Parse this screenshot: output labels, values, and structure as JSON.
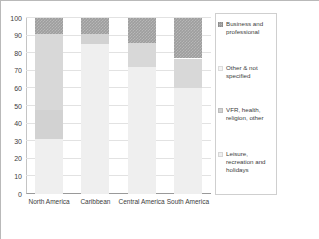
{
  "chart_data": {
    "type": "bar",
    "subtype": "stacked-bar-100",
    "title": "",
    "xlabel": "",
    "ylabel": "",
    "ylim": [
      0,
      100
    ],
    "yticks": [
      0,
      10,
      20,
      30,
      40,
      50,
      60,
      70,
      80,
      90,
      100
    ],
    "grid": true,
    "legend_position": "right",
    "categories": [
      "North America",
      "Caribbean",
      "Central America",
      "South America"
    ],
    "series": [
      {
        "name": "Leisure, recreation and holidays",
        "color": "#efefef",
        "values": [
          31,
          85,
          72,
          60
        ]
      },
      {
        "name": "VFR, health, religion, other",
        "color": "#d2d2d2",
        "values": [
          17,
          6,
          0,
          0
        ]
      },
      {
        "name": "Other & not specified",
        "color": "#d8d8d8",
        "values": [
          43,
          0,
          14,
          17
        ]
      },
      {
        "name": "Business and professional",
        "color": "#9e9e9e",
        "values": [
          9,
          9,
          14,
          23
        ]
      }
    ]
  },
  "axis": {
    "y_tick_labels": [
      "100",
      "90",
      "80",
      "70",
      "60",
      "50",
      "40",
      "30",
      "20",
      "10",
      "0"
    ],
    "x_tick_labels": [
      "North America",
      "Caribbean",
      "Central America",
      "South America"
    ]
  },
  "legend": {
    "items": [
      {
        "label": "Business and professional",
        "color": "#9e9e9e"
      },
      {
        "label": "Other & not specified",
        "color": "#f4f4f4"
      },
      {
        "label": "VFR, health, religion, other",
        "color": "#d2d2d2"
      },
      {
        "label": "Leisure, recreation and holidays",
        "color": "#efefef"
      }
    ]
  }
}
